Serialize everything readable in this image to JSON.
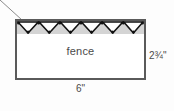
{
  "figure": {
    "title_text": "",
    "shape": "rectangle",
    "interior_label": "fence",
    "callout_target": "fence",
    "dimensions": {
      "width_label": "6\"",
      "height_label": "2¾\""
    },
    "fence_band": {
      "zigzag_count": 6,
      "vertex_dots": true,
      "fill_color": "#d4d4d4",
      "stroke_color": "#111111"
    },
    "colors": {
      "background": "#fdfdfd",
      "rect_border": "#5a5a5a",
      "rect_fill": "#ffffff",
      "band_fill": "#d4d4d4",
      "text": "#4a4a4a",
      "leader_line": "#8a8a8a"
    },
    "icons": {
      "leader_line": "callout-leader-line-icon",
      "zigzag": "zigzag-fence-icon"
    }
  }
}
